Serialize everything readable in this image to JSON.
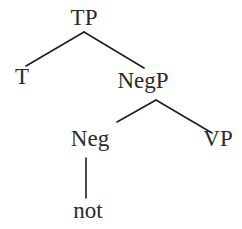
{
  "diagram": {
    "type": "syntax-tree",
    "nodes": [
      {
        "id": "TP",
        "label": "TP",
        "x": 84,
        "y": 25
      },
      {
        "id": "T",
        "label": "T",
        "x": 22,
        "y": 84
      },
      {
        "id": "NegP",
        "label": "NegP",
        "x": 143,
        "y": 88
      },
      {
        "id": "Neg",
        "label": "Neg",
        "x": 90,
        "y": 146
      },
      {
        "id": "VP",
        "label": "VP",
        "x": 218,
        "y": 146
      },
      {
        "id": "not",
        "label": "not",
        "x": 88,
        "y": 218
      }
    ],
    "edges": [
      {
        "from": "TP",
        "to": "T",
        "x1": 84,
        "y1": 32,
        "x2": 26,
        "y2": 66
      },
      {
        "from": "TP",
        "to": "NegP",
        "x1": 84,
        "y1": 32,
        "x2": 144,
        "y2": 68
      },
      {
        "from": "NegP",
        "to": "Neg",
        "x1": 156,
        "y1": 100,
        "x2": 117,
        "y2": 122
      },
      {
        "from": "NegP",
        "to": "VP",
        "x1": 156,
        "y1": 100,
        "x2": 212,
        "y2": 133
      },
      {
        "from": "Neg",
        "to": "not",
        "x1": 86,
        "y1": 158,
        "x2": 86,
        "y2": 198
      }
    ]
  }
}
